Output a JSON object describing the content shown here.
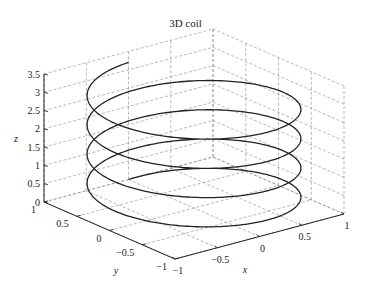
{
  "chart_data": {
    "type": "line3d",
    "title": "3D coil",
    "xlabel": "x",
    "ylabel": "y",
    "zlabel": "z",
    "xlim": [
      -1,
      1
    ],
    "ylim": [
      -1,
      1
    ],
    "zlim": [
      0,
      3.5
    ],
    "xticks": [
      "-1",
      "-0.5",
      "0",
      "0.5",
      "1"
    ],
    "yticks": [
      "-1",
      "-0.5",
      "0",
      "0.5",
      "1"
    ],
    "zticks": [
      "0",
      "0.5",
      "1",
      "1.5",
      "2",
      "2.5",
      "3",
      "3.5"
    ],
    "grid": true,
    "series": [
      {
        "name": "coil",
        "equation": "x = sin(t), y = cos(t), z = 0.4*t/pi, t in [0, 8*pi]",
        "turns": 4,
        "radius": 1,
        "z_start": 0,
        "z_end": 3.2,
        "color": "#222222"
      }
    ]
  },
  "colors": {
    "line": "#222222",
    "grid": "#888888",
    "axis": "#222222"
  }
}
